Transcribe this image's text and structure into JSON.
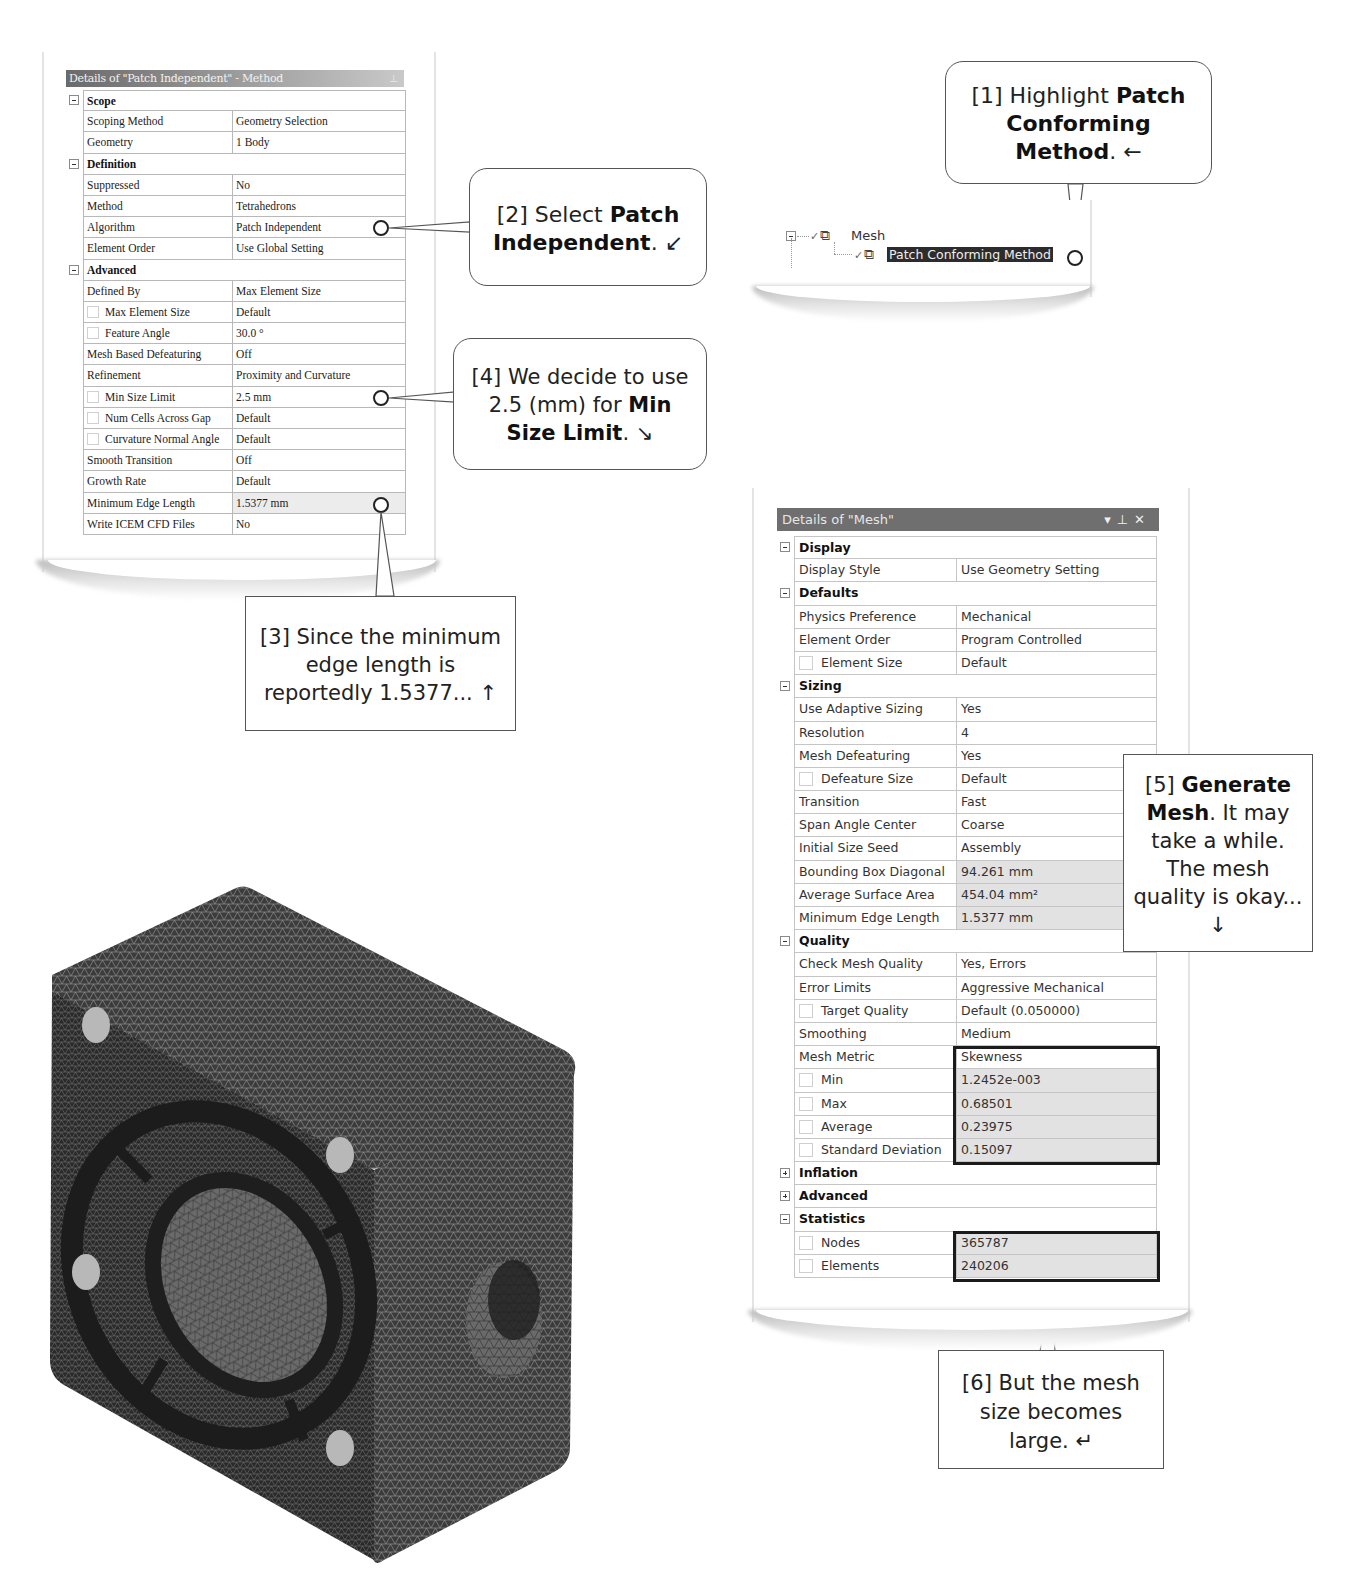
{
  "method_panel": {
    "title": "Details of \"Patch Independent\" - Method",
    "pin_icon": "pin-icon",
    "rows": [
      {
        "type": "group",
        "label": "Scope"
      },
      {
        "type": "prop",
        "key": "Scoping Method",
        "value": "Geometry Selection"
      },
      {
        "type": "prop",
        "key": "Geometry",
        "value": "1 Body"
      },
      {
        "type": "group",
        "label": "Definition"
      },
      {
        "type": "prop",
        "key": "Suppressed",
        "value": "No"
      },
      {
        "type": "prop",
        "key": "Method",
        "value": "Tetrahedrons"
      },
      {
        "type": "prop",
        "key": "Algorithm",
        "value": "Patch Independent"
      },
      {
        "type": "prop",
        "key": "Element Order",
        "value": "Use Global Setting"
      },
      {
        "type": "group",
        "label": "Advanced"
      },
      {
        "type": "prop",
        "key": "Defined By",
        "value": "Max Element Size"
      },
      {
        "type": "prop",
        "key": "Max Element Size",
        "value": "Default",
        "checkbox": true
      },
      {
        "type": "prop",
        "key": "Feature Angle",
        "value": "30.0 °",
        "checkbox": true
      },
      {
        "type": "prop",
        "key": "Mesh Based Defeaturing",
        "value": "Off"
      },
      {
        "type": "prop",
        "key": "Refinement",
        "value": "Proximity and Curvature"
      },
      {
        "type": "prop",
        "key": "Min Size Limit",
        "value": "2.5 mm",
        "checkbox": true
      },
      {
        "type": "prop",
        "key": "Num Cells Across Gap",
        "value": "Default",
        "checkbox": true
      },
      {
        "type": "prop",
        "key": "Curvature Normal Angle",
        "value": "Default",
        "checkbox": true
      },
      {
        "type": "prop",
        "key": "Smooth Transition",
        "value": "Off"
      },
      {
        "type": "prop",
        "key": "Growth Rate",
        "value": "Default"
      },
      {
        "type": "prop",
        "key": "Minimum Edge Length",
        "value": "1.5377 mm",
        "highlight": true
      },
      {
        "type": "prop",
        "key": "Write ICEM CFD Files",
        "value": "No"
      }
    ]
  },
  "tree": {
    "root_label": "Mesh",
    "child_label": "Patch Conforming Method"
  },
  "callouts": {
    "c1": {
      "prefix": "[1] Highlight ",
      "bold": "Patch Conforming Method",
      "suffix": ". ←"
    },
    "c2": {
      "prefix": "[2] Select ",
      "bold": "Patch Independent",
      "suffix": ". ↙"
    },
    "c3": {
      "text": "[3] Since the minimum edge length is reportedly 1.5377... ↑"
    },
    "c4": {
      "prefix": "[4] We decide to use 2.5 (mm) for ",
      "bold": "Min Size Limit",
      "suffix": ". ↘"
    },
    "c5": {
      "prefix": "[5] ",
      "bold": "Generate Mesh",
      "suffix": ". It may take a while. The mesh quality is okay... ↓"
    },
    "c6": {
      "text": "[6] But the mesh size becomes large. ↵"
    }
  },
  "mesh_panel": {
    "title": "Details of \"Mesh\"",
    "controls": [
      "▾",
      "⊥",
      "✕"
    ],
    "rows": [
      {
        "type": "group",
        "label": "Display",
        "expanded": true
      },
      {
        "type": "prop",
        "key": "Display Style",
        "value": "Use Geometry Setting"
      },
      {
        "type": "group",
        "label": "Defaults",
        "expanded": true
      },
      {
        "type": "prop",
        "key": "Physics Preference",
        "value": "Mechanical"
      },
      {
        "type": "prop",
        "key": "Element Order",
        "value": "Program Controlled"
      },
      {
        "type": "prop",
        "key": "Element Size",
        "value": "Default",
        "checkbox": true
      },
      {
        "type": "group",
        "label": "Sizing",
        "expanded": true
      },
      {
        "type": "prop",
        "key": "Use Adaptive Sizing",
        "value": "Yes"
      },
      {
        "type": "prop",
        "key": "Resolution",
        "value": "4"
      },
      {
        "type": "prop",
        "key": "Mesh Defeaturing",
        "value": "Yes"
      },
      {
        "type": "prop",
        "key": "Defeature Size",
        "value": "Default",
        "checkbox": true
      },
      {
        "type": "prop",
        "key": "Transition",
        "value": "Fast"
      },
      {
        "type": "prop",
        "key": "Span Angle Center",
        "value": "Coarse"
      },
      {
        "type": "prop",
        "key": "Initial Size Seed",
        "value": "Assembly"
      },
      {
        "type": "prop",
        "key": "Bounding Box Diagonal",
        "value": "94.261 mm",
        "highlight": true
      },
      {
        "type": "prop",
        "key": "Average Surface Area",
        "value": "454.04 mm²",
        "highlight": true
      },
      {
        "type": "prop",
        "key": "Minimum Edge Length",
        "value": "1.5377 mm",
        "highlight": true
      },
      {
        "type": "group",
        "label": "Quality",
        "expanded": true
      },
      {
        "type": "prop",
        "key": "Check Mesh Quality",
        "value": "Yes, Errors"
      },
      {
        "type": "prop",
        "key": "Error Limits",
        "value": "Aggressive Mechanical"
      },
      {
        "type": "prop",
        "key": "Target Quality",
        "value": "Default (0.050000)",
        "checkbox": true
      },
      {
        "type": "prop",
        "key": "Smoothing",
        "value": "Medium"
      },
      {
        "type": "prop",
        "key": "Mesh Metric",
        "value": "Skewness"
      },
      {
        "type": "prop",
        "key": "Min",
        "value": "1.2452e-003",
        "checkbox": true,
        "highlight": true
      },
      {
        "type": "prop",
        "key": "Max",
        "value": "0.68501",
        "checkbox": true,
        "highlight": true
      },
      {
        "type": "prop",
        "key": "Average",
        "value": "0.23975",
        "checkbox": true,
        "highlight": true
      },
      {
        "type": "prop",
        "key": "Standard Deviation",
        "value": "0.15097",
        "checkbox": true,
        "highlight": true
      },
      {
        "type": "group",
        "label": "Inflation",
        "expanded": false
      },
      {
        "type": "group",
        "label": "Advanced",
        "expanded": false
      },
      {
        "type": "group",
        "label": "Statistics",
        "expanded": true
      },
      {
        "type": "prop",
        "key": "Nodes",
        "value": "365787",
        "checkbox": true,
        "highlight": true
      },
      {
        "type": "prop",
        "key": "Elements",
        "value": "240206",
        "checkbox": true,
        "highlight": true
      }
    ]
  },
  "model": {
    "icon": "meshed-fan-housing-3d-model"
  }
}
